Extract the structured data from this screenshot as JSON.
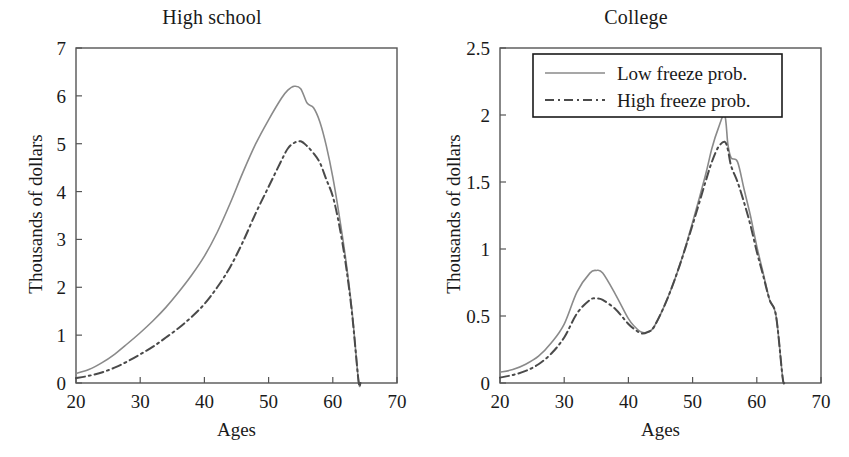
{
  "chart_data": [
    {
      "type": "line",
      "title": "High school",
      "xlabel": "Ages",
      "ylabel": "Thousands of dollars",
      "xlim": [
        20,
        70
      ],
      "ylim": [
        0,
        7
      ],
      "xticks": [
        20,
        30,
        40,
        50,
        60,
        70
      ],
      "yticks": [
        0,
        1,
        2,
        3,
        4,
        5,
        6,
        7
      ],
      "xticklabels": [
        "20",
        "30",
        "40",
        "50",
        "60",
        "70"
      ],
      "yticklabels": [
        "0",
        "1",
        "2",
        "3",
        "4",
        "5",
        "6",
        "7"
      ],
      "grid": false,
      "legend": null,
      "x": [
        20,
        22,
        24,
        26,
        28,
        30,
        32,
        34,
        36,
        38,
        40,
        42,
        44,
        46,
        48,
        50,
        52,
        53,
        54,
        55,
        56,
        57,
        58,
        59,
        60,
        61,
        62,
        63,
        64,
        64.3
      ],
      "series": [
        {
          "name": "Low freeze prob.",
          "style": "solid",
          "color": "#8a8a8a",
          "values": [
            0.2,
            0.28,
            0.42,
            0.6,
            0.82,
            1.05,
            1.3,
            1.58,
            1.9,
            2.25,
            2.65,
            3.15,
            3.75,
            4.4,
            5.0,
            5.5,
            5.95,
            6.12,
            6.2,
            6.15,
            5.85,
            5.75,
            5.45,
            4.95,
            4.3,
            3.5,
            2.6,
            1.5,
            0.05,
            0.0
          ]
        },
        {
          "name": "High freeze prob.",
          "style": "dashdot",
          "color": "#4a4a4a",
          "values": [
            0.1,
            0.15,
            0.22,
            0.32,
            0.45,
            0.6,
            0.76,
            0.95,
            1.15,
            1.38,
            1.65,
            2.0,
            2.42,
            2.95,
            3.55,
            4.1,
            4.65,
            4.9,
            5.02,
            5.05,
            4.95,
            4.8,
            4.6,
            4.25,
            3.9,
            3.3,
            2.5,
            1.45,
            0.05,
            0.0
          ]
        }
      ]
    },
    {
      "type": "line",
      "title": "College",
      "xlabel": "Ages",
      "ylabel": "Thousands of dollars",
      "xlim": [
        20,
        70
      ],
      "ylim": [
        0,
        2.5
      ],
      "xticks": [
        20,
        30,
        40,
        50,
        60,
        70
      ],
      "yticks": [
        0,
        0.5,
        1,
        1.5,
        2,
        2.5
      ],
      "xticklabels": [
        "20",
        "30",
        "40",
        "50",
        "60",
        "70"
      ],
      "yticklabels": [
        "0",
        "0.5",
        "1",
        "1.5",
        "2",
        "2.5"
      ],
      "grid": false,
      "legend": {
        "position": "top-center",
        "entries": [
          {
            "label": "Low freeze prob.",
            "style": "solid",
            "color": "#8a8a8a"
          },
          {
            "label": "High freeze prob.",
            "style": "dashdot",
            "color": "#4a4a4a"
          }
        ]
      },
      "x": [
        20,
        22,
        24,
        26,
        28,
        30,
        32,
        34,
        35,
        36,
        38,
        40,
        41,
        42,
        43,
        44,
        46,
        48,
        50,
        52,
        53,
        54,
        55,
        55.5,
        56,
        57,
        58,
        59,
        60,
        61,
        62,
        63,
        64,
        64.3
      ],
      "series": [
        {
          "name": "Low freeze prob.",
          "style": "solid",
          "color": "#8a8a8a",
          "values": [
            0.08,
            0.1,
            0.14,
            0.2,
            0.3,
            0.44,
            0.68,
            0.82,
            0.84,
            0.82,
            0.66,
            0.48,
            0.42,
            0.38,
            0.38,
            0.42,
            0.62,
            0.88,
            1.2,
            1.55,
            1.75,
            1.9,
            2.0,
            1.78,
            1.68,
            1.65,
            1.45,
            1.25,
            1.02,
            0.82,
            0.62,
            0.5,
            0.05,
            0.0
          ]
        },
        {
          "name": "High freeze prob.",
          "style": "dashdot",
          "color": "#4a4a4a",
          "values": [
            0.04,
            0.06,
            0.09,
            0.14,
            0.22,
            0.34,
            0.52,
            0.62,
            0.63,
            0.62,
            0.55,
            0.44,
            0.4,
            0.37,
            0.38,
            0.42,
            0.62,
            0.88,
            1.18,
            1.5,
            1.65,
            1.76,
            1.8,
            1.74,
            1.62,
            1.5,
            1.35,
            1.18,
            0.98,
            0.8,
            0.62,
            0.5,
            0.05,
            0.0
          ]
        }
      ]
    }
  ],
  "panels": [
    {
      "title": "High school",
      "ylabel": "Thousands of dollars",
      "xlabel": "Ages"
    },
    {
      "title": "College",
      "ylabel": "Thousands of dollars",
      "xlabel": "Ages"
    }
  ],
  "colors": {
    "solid_line": "#8a8a8a",
    "dashdot_line": "#4a4a4a",
    "axis": "#555555",
    "text": "#1a1a1a",
    "background": "#ffffff"
  }
}
